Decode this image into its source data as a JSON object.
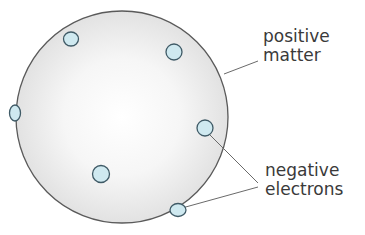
{
  "diagram": {
    "colors": {
      "sphere_fill": "#ececec",
      "sphere_stroke": "#5a5a5a",
      "electron_fill": "#cfe9f0",
      "electron_stroke": "#3f5a66",
      "leader_line": "#6a6a6a",
      "label_text": "#3a3a3a"
    },
    "labels": {
      "positive_line1": "positive",
      "positive_line2": "matter",
      "negative_line1": "negative",
      "negative_line2": "electrons"
    },
    "electrons": [
      {
        "id": 1,
        "cx": 71,
        "cy": 39
      },
      {
        "id": 2,
        "cx": 174,
        "cy": 52
      },
      {
        "id": 3,
        "cx": 15,
        "cy": 113
      },
      {
        "id": 4,
        "cx": 205,
        "cy": 128
      },
      {
        "id": 5,
        "cx": 101,
        "cy": 174
      },
      {
        "id": 6,
        "cx": 178,
        "cy": 210
      }
    ]
  }
}
